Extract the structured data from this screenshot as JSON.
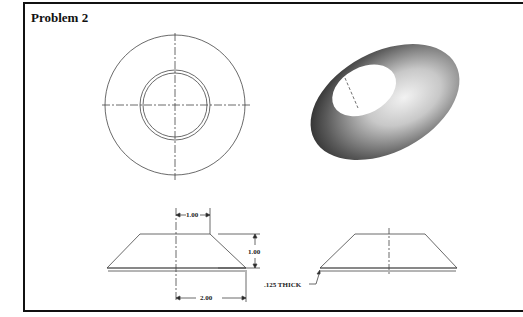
{
  "title": "Problem 2",
  "views": {
    "top_view": "front circular view with concentric circles and centerlines",
    "isometric": "shaded 3D conical washer",
    "section_dimensioned": "side view with dimensions",
    "section_plain": "side view"
  },
  "dimensions": {
    "top_width": "1.00",
    "height": "1.00",
    "base_half_width": "2.00",
    "thickness": ".125 THICK"
  }
}
